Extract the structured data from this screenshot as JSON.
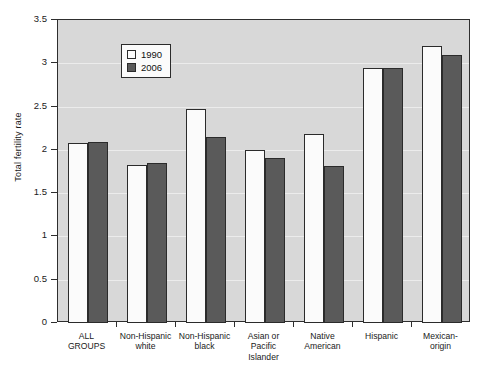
{
  "chart_data": {
    "type": "bar",
    "title": "",
    "xlabel": "",
    "ylabel": "Total fertility rate",
    "ylim": [
      0,
      3.5
    ],
    "ytick_labels": [
      "0",
      "0.5",
      "1",
      "1.5",
      "2",
      "2.5",
      "3",
      "3.5"
    ],
    "ytick_values": [
      0,
      0.5,
      1,
      1.5,
      2,
      2.5,
      3,
      3.5
    ],
    "grid": true,
    "legend_position": "top-left",
    "categories": [
      "ALL GROUPS",
      "Non-Hispanic white",
      "Non-Hispanic black",
      "Asian or Pacific Islander",
      "Native American",
      "Hispanic",
      "Mexican-origin"
    ],
    "category_lines": [
      [
        "ALL",
        "GROUPS"
      ],
      [
        "Non-Hispanic",
        "white"
      ],
      [
        "Non-Hispanic",
        "black"
      ],
      [
        "Asian or",
        "Pacific",
        "Islander"
      ],
      [
        "Native",
        "American"
      ],
      [
        "Hispanic"
      ],
      [
        "Mexican-",
        "origin"
      ]
    ],
    "series": [
      {
        "name": "1990",
        "color": "#fbfbfb",
        "values": [
          2.08,
          1.83,
          2.47,
          2.0,
          2.18,
          2.95,
          3.2
        ]
      },
      {
        "name": "2006",
        "color": "#5a5a5a",
        "values": [
          2.09,
          1.85,
          2.15,
          1.91,
          1.81,
          2.95,
          3.1
        ]
      }
    ]
  },
  "legend": {
    "items": [
      {
        "label": "1990",
        "swatch": "open-square-white"
      },
      {
        "label": "2006",
        "swatch": "filled-square-gray"
      }
    ]
  },
  "colors": {
    "plot_background": "#d8d8d8",
    "gridline": "#ececec",
    "axis": "#2e2e2e",
    "bar_1990": "#fbfbfb",
    "bar_2006": "#5a5a5a",
    "text": "#1a1a1a"
  }
}
